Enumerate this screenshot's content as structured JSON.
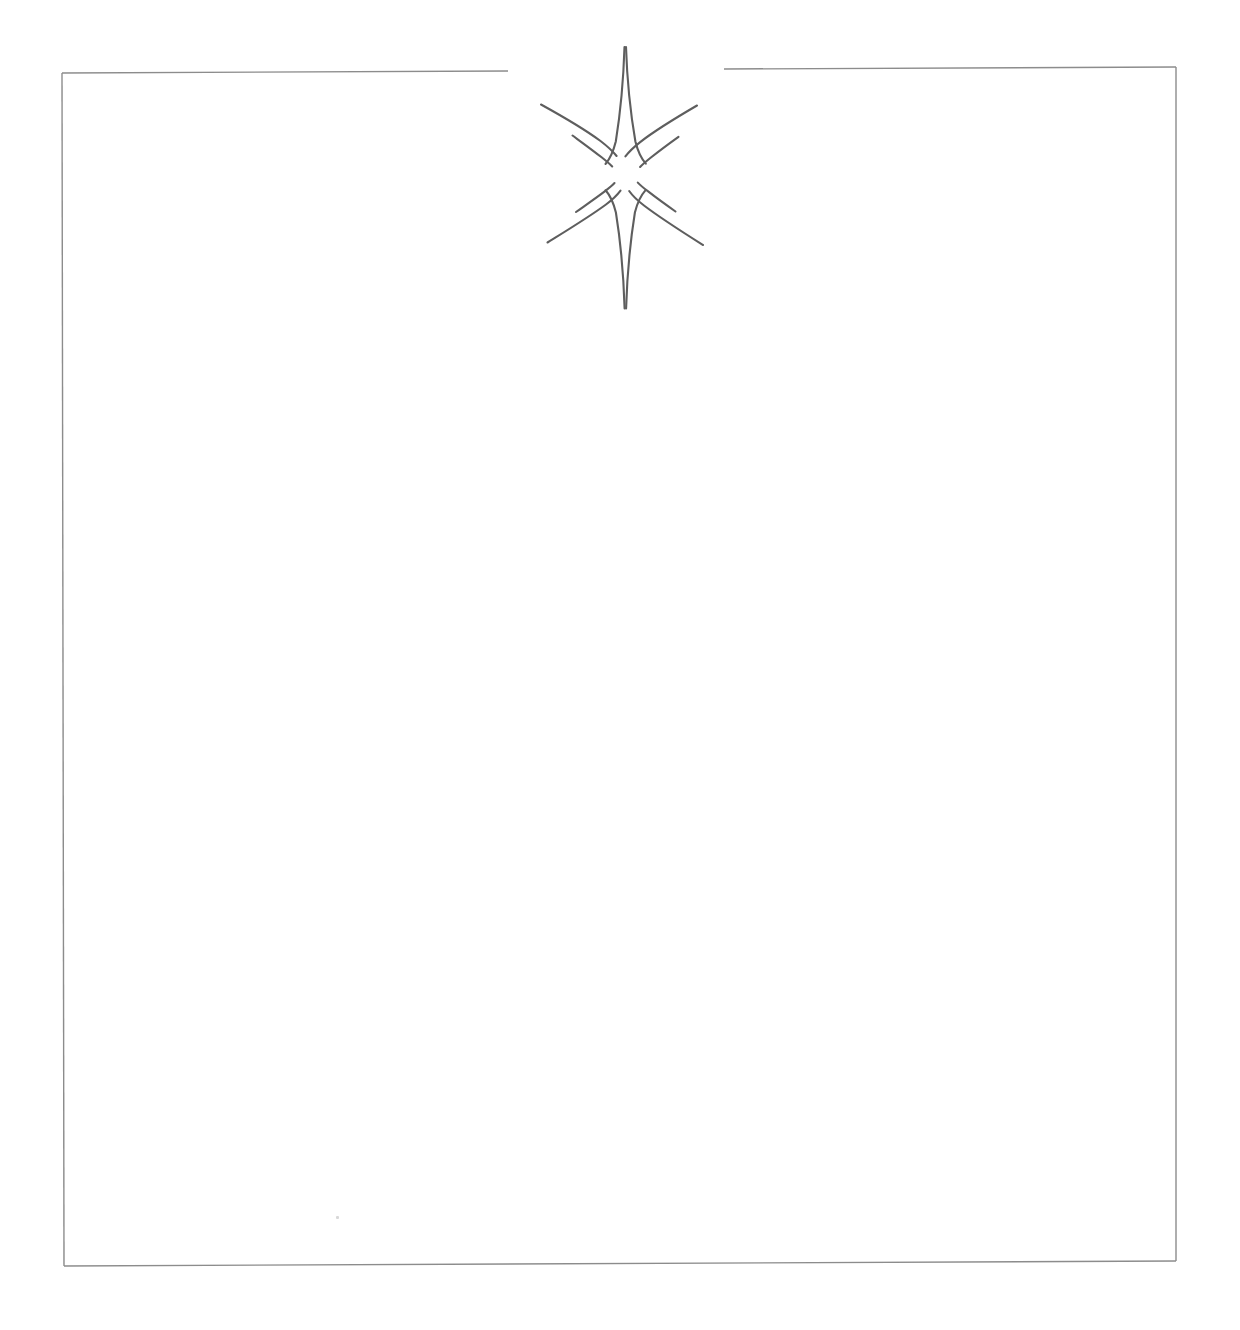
{
  "document": {
    "title": "Certificate Border With Eight Point Star",
    "background_color": "#ffffff",
    "width": 1240,
    "height": 1330
  },
  "frame": {
    "name": "page-border-rectangle",
    "stroke_color": "#8c8c8c",
    "stroke_width": 1.4,
    "left": 62,
    "top": 71,
    "right": 1176,
    "bottom": 1263,
    "top_gap": {
      "description": "break in top rule where the star sits",
      "gap_start_x": 508,
      "gap_end_x": 724
    },
    "segments": [
      {
        "label": "top-left-rule",
        "x1": 62,
        "y1": 73,
        "x2": 508,
        "y2": 71
      },
      {
        "label": "top-right-rule",
        "x1": 724,
        "y1": 69,
        "x2": 1176,
        "y2": 67
      },
      {
        "label": "right-rule",
        "x1": 1176,
        "y1": 67,
        "x2": 1176,
        "y2": 1261
      },
      {
        "label": "bottom-rule",
        "x1": 64,
        "y1": 1266,
        "x2": 1176,
        "y2": 1261
      },
      {
        "label": "left-rule",
        "x1": 62,
        "y1": 73,
        "x2": 64,
        "y2": 1266
      }
    ]
  },
  "star": {
    "name": "eight-point-star-ornament",
    "stroke_color": "#5e5e5e",
    "stroke_width": 2.2,
    "center_x": 625,
    "center_y": 173,
    "point_count": 8,
    "bounds": {
      "x": 538,
      "y": 46,
      "width": 168,
      "height": 264
    },
    "rays": [
      {
        "label": "north-ray",
        "tip_x": 625,
        "tip_y": 46,
        "length": 127,
        "weight": "long"
      },
      {
        "label": "south-ray",
        "tip_x": 625,
        "tip_y": 309,
        "length": 136,
        "weight": "long"
      },
      {
        "label": "northwest-ray",
        "tip_x": 541,
        "tip_y": 104,
        "length": 103,
        "weight": "medium"
      },
      {
        "label": "northeast-ray",
        "tip_x": 697,
        "tip_y": 105,
        "length": 99,
        "weight": "medium"
      },
      {
        "label": "southwest-ray",
        "tip_x": 547,
        "tip_y": 243,
        "length": 109,
        "weight": "medium"
      },
      {
        "label": "southeast-ray",
        "tip_x": 703,
        "tip_y": 245,
        "length": 110,
        "weight": "medium"
      },
      {
        "label": "west-inner-spike",
        "tip_x": 572,
        "tip_y": 135,
        "length": 66,
        "weight": "short"
      },
      {
        "label": "east-inner-spike",
        "tip_x": 679,
        "tip_y": 137,
        "length": 65,
        "weight": "short"
      },
      {
        "label": "southwest-inner-spike",
        "tip_x": 576,
        "tip_y": 212,
        "length": 62,
        "weight": "short"
      },
      {
        "label": "southeast-inner-spike",
        "tip_x": 676,
        "tip_y": 212,
        "length": 62,
        "weight": "short"
      }
    ]
  },
  "content_area": {
    "name": "blank-body-region",
    "text": "",
    "description": "empty white writing area inside the border"
  },
  "artifacts": [
    {
      "label": "scan-speck",
      "x": 336,
      "y": 1216,
      "color": "#d8d8d8"
    }
  ],
  "captions": {
    "header_text": "",
    "footer_text": ""
  }
}
